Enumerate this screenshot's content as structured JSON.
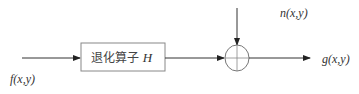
{
  "diagram": {
    "type": "block-diagram",
    "nodes": [
      {
        "id": "degradation-operator",
        "label_text": "退化算子 ",
        "label_var": "H"
      },
      {
        "id": "summing-junction",
        "label_text": "",
        "symbol": "plus-circle"
      }
    ],
    "labels": {
      "input": "f(x,y)",
      "noise": "n(x,y)",
      "output": "g(x,y)"
    },
    "edges": [
      {
        "from": "input",
        "to": "degradation-operator"
      },
      {
        "from": "degradation-operator",
        "to": "summing-junction"
      },
      {
        "from": "noise",
        "to": "summing-junction"
      },
      {
        "from": "summing-junction",
        "to": "output"
      }
    ],
    "colors": {
      "stroke": "#333333",
      "circle": "#777777",
      "box": "#888888"
    }
  }
}
